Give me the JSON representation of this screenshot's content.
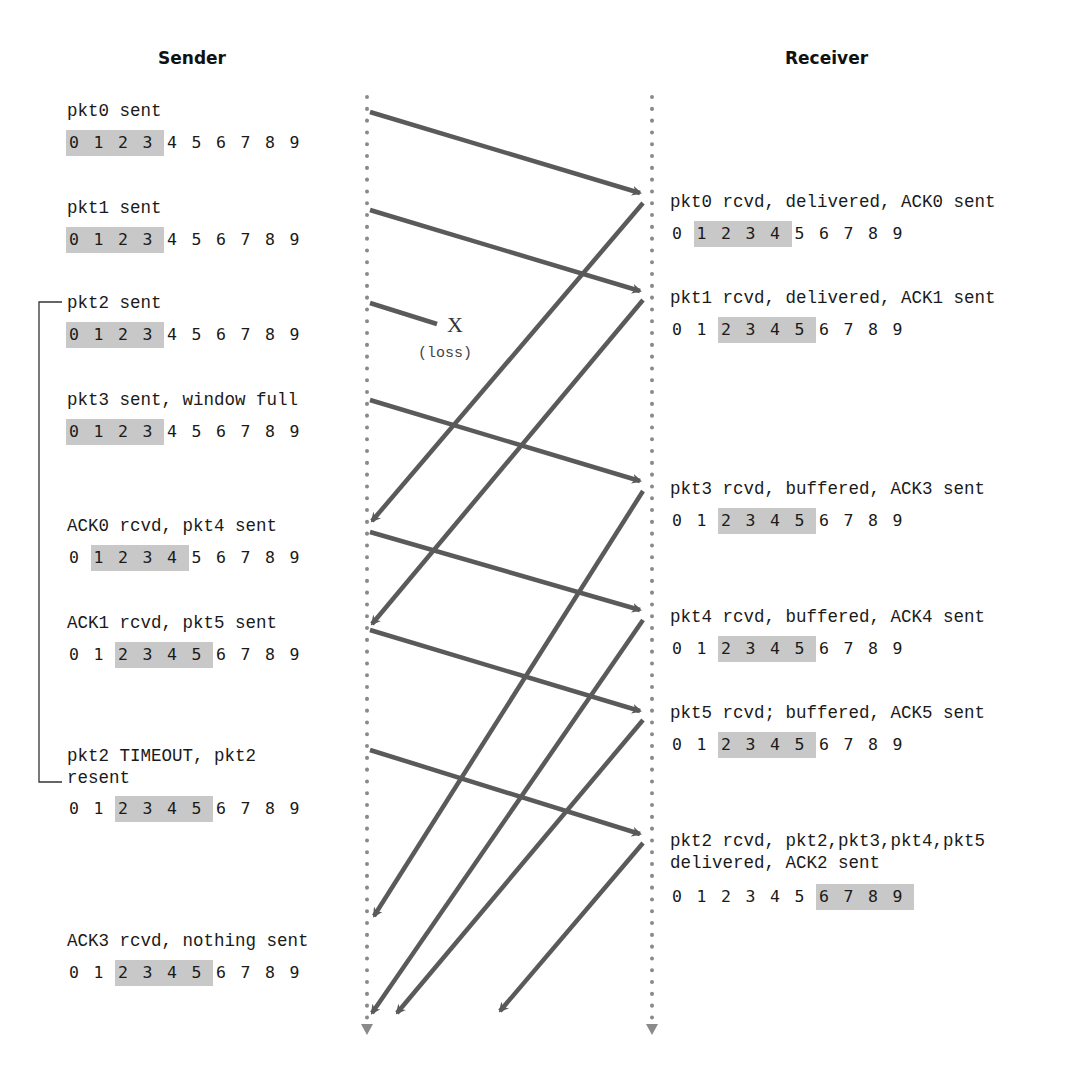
{
  "headings": {
    "sender": "Sender",
    "receiver": "Receiver"
  },
  "sender_events": [
    {
      "label": "pkt0 sent",
      "window": [
        0,
        1,
        2,
        3
      ]
    },
    {
      "label": "pkt1 sent",
      "window": [
        0,
        1,
        2,
        3
      ]
    },
    {
      "label": "pkt2 sent",
      "window": [
        0,
        1,
        2,
        3
      ]
    },
    {
      "label": "pkt3 sent, window full",
      "window": [
        0,
        1,
        2,
        3
      ]
    },
    {
      "label": "ACK0 rcvd, pkt4 sent",
      "window": [
        1,
        2,
        3,
        4
      ]
    },
    {
      "label": "ACK1 rcvd, pkt5 sent",
      "window": [
        2,
        3,
        4,
        5
      ]
    },
    {
      "label": "pkt2 TIMEOUT, pkt2\nresent",
      "window": [
        2,
        3,
        4,
        5
      ]
    },
    {
      "label": "ACK3 rcvd, nothing sent",
      "window": [
        2,
        3,
        4,
        5
      ]
    }
  ],
  "receiver_events": [
    {
      "label": "pkt0 rcvd, delivered, ACK0 sent",
      "window": [
        1,
        2,
        3,
        4
      ]
    },
    {
      "label": "pkt1 rcvd, delivered, ACK1 sent",
      "window": [
        2,
        3,
        4,
        5
      ]
    },
    {
      "label": "pkt3 rcvd, buffered, ACK3 sent",
      "window": [
        2,
        3,
        4,
        5
      ]
    },
    {
      "label": "pkt4 rcvd, buffered, ACK4 sent",
      "window": [
        2,
        3,
        4,
        5
      ]
    },
    {
      "label": "pkt5 rcvd; buffered, ACK5 sent",
      "window": [
        2,
        3,
        4,
        5
      ]
    },
    {
      "label": "pkt2 rcvd, pkt2,pkt3,pkt4,pkt5\ndelivered, ACK2 sent",
      "window": [
        6,
        7,
        8,
        9
      ]
    }
  ],
  "sequence_numbers": [
    "0",
    "1",
    "2",
    "3",
    "4",
    "5",
    "6",
    "7",
    "8",
    "9"
  ],
  "loss": {
    "mark": "X",
    "label": "(loss)"
  },
  "colors": {
    "arrow": "#5a5a5a",
    "timeline": "#8a8a8a",
    "window_fill": "#c8c8c8",
    "text": "#1a1a1a"
  }
}
